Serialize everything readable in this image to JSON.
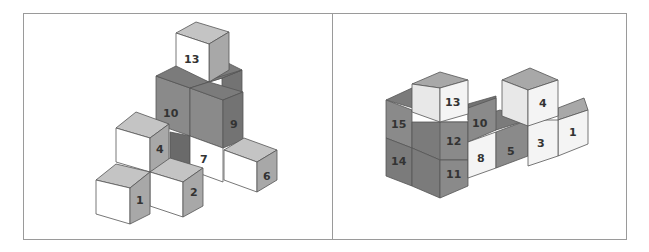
{
  "colors": {
    "frame": "#9a9a9a",
    "edge": "#555555",
    "white_front": "#ffffff",
    "white_top": "#bdbdbd",
    "white_side": "#a8a8a8",
    "dark_front": "#8a8a8a",
    "dark_top": "#7b7b7b",
    "dark_side": "#737373",
    "label": "#333333"
  },
  "panels": [
    {
      "name": "left-view",
      "cube": {
        "w": 33,
        "dx": 20,
        "dy": -10
      },
      "cubes": [
        {
          "id": "15",
          "x": 222,
          "y": 78,
          "shade": "dark",
          "label": "15",
          "face": "side"
        },
        {
          "id": "u9b",
          "x": 202,
          "y": 88,
          "shade": "dark",
          "label": "",
          "face": "none"
        },
        {
          "id": "13",
          "x": 176,
          "y": 33,
          "shade": "white",
          "label": "13",
          "face": "front"
        },
        {
          "id": "10",
          "x": 156,
          "y": 76,
          "shade": "dark",
          "label": "10",
          "face": "front"
        },
        {
          "id": "9",
          "x": 190,
          "y": 86,
          "shade": "dark",
          "label": "9",
          "face": "side"
        },
        {
          "id": "hid",
          "x": 170,
          "y": 118,
          "shade": "dark",
          "label": "",
          "face": "none"
        },
        {
          "id": "7",
          "x": 190,
          "y": 138,
          "shade": "white",
          "label": "7",
          "face": "front"
        },
        {
          "id": "6",
          "x": 224,
          "y": 150,
          "shade": "white",
          "label": "6",
          "face": "side"
        },
        {
          "id": "4",
          "x": 116,
          "y": 128,
          "shade": "white",
          "label": "4",
          "face": "side"
        },
        {
          "id": "2",
          "x": 150,
          "y": 172,
          "shade": "white",
          "label": "2",
          "face": "side"
        },
        {
          "id": "1",
          "x": 96,
          "y": 180,
          "shade": "white",
          "label": "1",
          "face": "side"
        }
      ]
    },
    {
      "name": "right-view",
      "cube": {
        "w": 27,
        "dx": 30,
        "dy": -12
      },
      "cubes": [
        {
          "id": "14",
          "x": 386,
          "y": 138,
          "shade": "dark",
          "label": "14",
          "face": "front"
        },
        {
          "id": "15",
          "x": 386,
          "y": 100,
          "shade": "dark",
          "label": "15",
          "face": "front"
        },
        {
          "id": "5",
          "x": 497,
          "y": 130,
          "shade": "dark",
          "label": "5",
          "face": "front"
        },
        {
          "id": "10",
          "x": 468,
          "y": 120,
          "shade": "dark",
          "label": "10",
          "face": "front"
        },
        {
          "id": "8",
          "x": 468,
          "y": 142,
          "shade": "white",
          "label": "8",
          "face": "front"
        },
        {
          "id": "11",
          "x": 412,
          "y": 160,
          "shade": "dark",
          "label": "11",
          "face": "front"
        },
        {
          "id": "12",
          "x": 412,
          "y": 122,
          "shade": "dark",
          "label": "12",
          "face": "front"
        },
        {
          "id": "13",
          "x": 412,
          "y": 84,
          "shade": "white",
          "label": "13",
          "face": "front"
        },
        {
          "id": "1",
          "x": 558,
          "y": 108,
          "shade": "white",
          "label": "1",
          "face": "front"
        },
        {
          "id": "3",
          "x": 528,
          "y": 120,
          "shade": "white",
          "label": "3",
          "face": "front"
        },
        {
          "id": "4",
          "x": 528,
          "y": 82,
          "shade": "white",
          "label": "4",
          "face": "front"
        }
      ]
    }
  ]
}
